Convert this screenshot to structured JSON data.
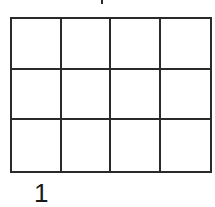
{
  "figure": {
    "label": "1",
    "grid": {
      "rows": 3,
      "columns": 4,
      "line_color": "#2a2a2a",
      "fill_color": "#ffffff"
    }
  }
}
